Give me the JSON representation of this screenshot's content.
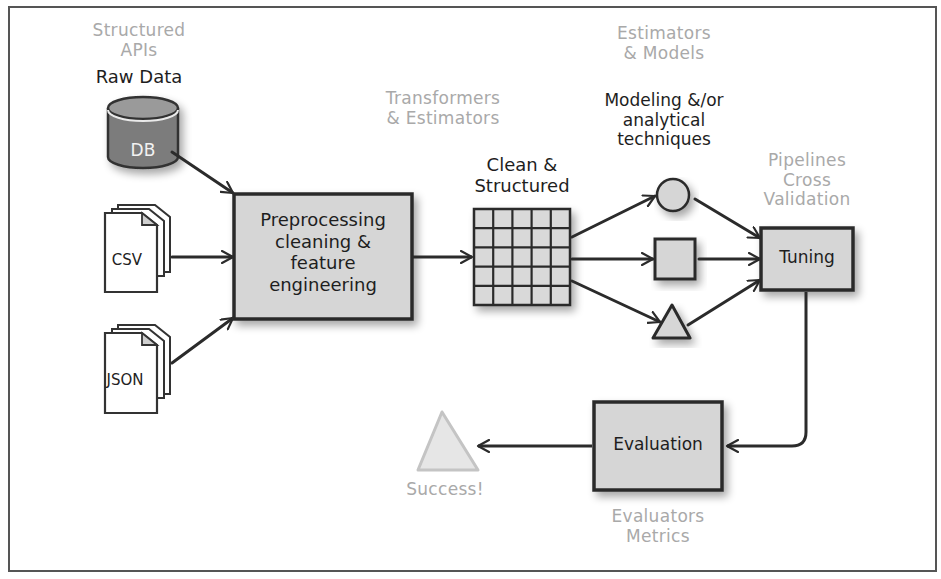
{
  "diagram": {
    "type": "ml-workflow",
    "colors": {
      "stroke": "#2b2b2b",
      "box_fill": "#d6d6d6",
      "db_fill": "#7c7c7c",
      "muted_text": "#a9a9a9",
      "success_fill": "#e6e6e6"
    },
    "sources": {
      "caption_muted": [
        "Structured",
        "APIs"
      ],
      "caption_dark": "Raw Data",
      "db_label": "DB",
      "csv_label": "CSV",
      "json_label": "JSON"
    },
    "preprocess": {
      "caption_muted": [
        "Transformers",
        "& Estimators"
      ],
      "box_lines": [
        "Preprocessing",
        "cleaning &",
        "feature",
        "engineering"
      ]
    },
    "clean": {
      "caption_dark": [
        "Clean &",
        "Structured"
      ],
      "grid_rows": 5,
      "grid_cols": 5
    },
    "models": {
      "caption_muted": [
        "Estimators",
        "& Models"
      ],
      "caption_dark": [
        "Modeling &/or",
        "analytical",
        "techniques"
      ],
      "shapes": [
        "circle",
        "square",
        "triangle"
      ]
    },
    "tuning": {
      "caption_muted": [
        "Pipelines",
        "Cross",
        "Validation"
      ],
      "box_label": "Tuning"
    },
    "evaluation": {
      "box_label": "Evaluation",
      "caption_muted": [
        "Evaluators",
        "Metrics"
      ]
    },
    "success": {
      "label": "Success!"
    }
  }
}
